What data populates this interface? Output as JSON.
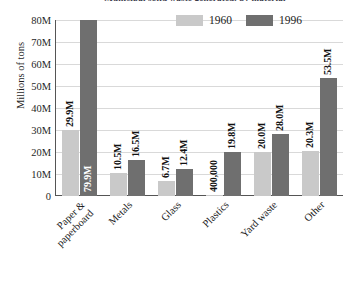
{
  "chart_data": {
    "type": "bar",
    "title": "Municipal solid waste generated, by material",
    "xlabel": "",
    "ylabel": "Millions of tons",
    "ylim": [
      0,
      80000000
    ],
    "grid": true,
    "legend_position": "top-right",
    "categories": [
      "Paper & paperboard",
      "Metals",
      "Glass",
      "Plastics",
      "Yard waste",
      "Other"
    ],
    "category_lines": [
      [
        "Paper &",
        "paperboard"
      ],
      [
        "Metals"
      ],
      [
        "Glass"
      ],
      [
        "Plastics"
      ],
      [
        "Yard waste"
      ],
      [
        "Other"
      ]
    ],
    "yticks": [
      "0",
      "10M",
      "20M",
      "30M",
      "40M",
      "50M",
      "60M",
      "70M",
      "80M"
    ],
    "ytick_values": [
      0,
      10000000,
      20000000,
      30000000,
      40000000,
      50000000,
      60000000,
      70000000,
      80000000
    ],
    "series": [
      {
        "name": "1960",
        "color": "#c9c9c9",
        "values": [
          29900000,
          10500000,
          6700000,
          400000,
          20000000,
          20300000
        ],
        "labels": [
          "29.9M",
          "10.5M",
          "6.7M",
          "400,000",
          "20.0M",
          "20.3M"
        ],
        "label_placement": [
          "outside",
          "outside",
          "outside",
          "outside",
          "outside",
          "outside"
        ]
      },
      {
        "name": "1996",
        "color": "#6f6f6f",
        "values": [
          79900000,
          16500000,
          12400000,
          19800000,
          28000000,
          53500000
        ],
        "labels": [
          "79.9M",
          "16.5M",
          "12.4M",
          "19.8M",
          "28.0M",
          "53.5M"
        ],
        "label_placement": [
          "inside",
          "outside",
          "outside",
          "outside",
          "outside",
          "outside"
        ]
      }
    ]
  },
  "colors": {
    "series_1960": "#c9c9c9",
    "series_1996": "#6f6f6f",
    "grid": "#d9d9d9",
    "axis": "#555555",
    "text": "#1a1a1a"
  }
}
